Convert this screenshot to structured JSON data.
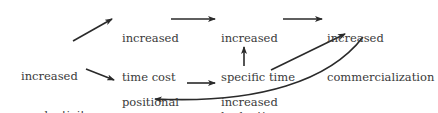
{
  "diagram": {
    "type": "flow",
    "nodes": [
      {
        "id": "productivity",
        "line1": "increased",
        "line2": "productivity"
      },
      {
        "id": "time_cost",
        "line1": "increased",
        "line2": "time cost"
      },
      {
        "id": "positional",
        "line1": "positional",
        "line2": "competition"
      },
      {
        "id": "budgeting",
        "line1": "increased",
        "line2": "specific time",
        "line3": "budgeting"
      },
      {
        "id": "needs",
        "line1": "increased",
        "line2": "needs"
      },
      {
        "id": "commercialization",
        "line1": "increased",
        "line2": "commercialization"
      }
    ],
    "edges": [
      {
        "from": "productivity",
        "to": "time_cost"
      },
      {
        "from": "productivity",
        "to": "positional"
      },
      {
        "from": "time_cost",
        "to": "budgeting"
      },
      {
        "from": "positional",
        "to": "needs"
      },
      {
        "from": "needs",
        "to": "budgeting"
      },
      {
        "from": "budgeting",
        "to": "commercialization"
      },
      {
        "from": "needs",
        "to": "commercialization"
      },
      {
        "from": "commercialization",
        "to": "positional"
      }
    ],
    "colors": {
      "text": "#3a3a3a",
      "arrow": "#2a2a2a",
      "background": "#ffffff"
    }
  }
}
